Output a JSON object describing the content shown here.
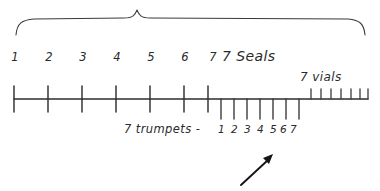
{
  "diagram": {
    "ink_color": "#2b2b2b",
    "background_color": "#ffffff"
  },
  "brace": {
    "name": "top-brace",
    "spans_label": "7 Seals"
  },
  "seals": {
    "label": "7 Seals",
    "numbers": [
      "1",
      "2",
      "3",
      "4",
      "5",
      "6",
      "7"
    ],
    "count": 7,
    "tick_direction": "both"
  },
  "trumpets": {
    "label": "7 trumpets -",
    "numbers": [
      "1",
      "2",
      "3",
      "4",
      "5",
      "6",
      "7"
    ],
    "count": 7,
    "tick_direction": "down"
  },
  "vials": {
    "label": "7 vials",
    "count": 7,
    "tick_direction": "up"
  },
  "arrow": {
    "name": "pointer-arrow",
    "direction": "up-right",
    "points_at": "7 trumpets"
  }
}
